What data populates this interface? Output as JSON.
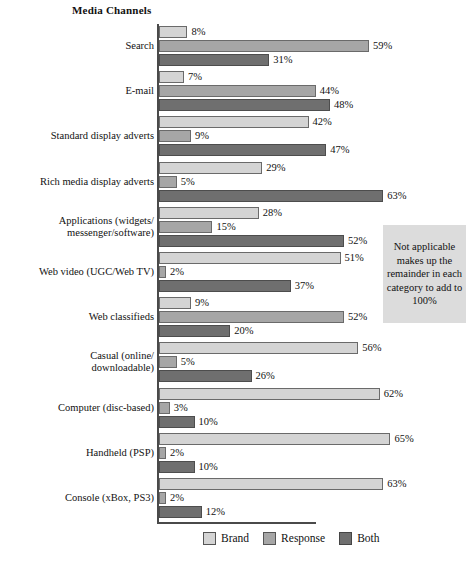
{
  "chart_data": {
    "type": "bar",
    "orientation": "horizontal",
    "title": "Media Channels",
    "xlabel": "",
    "ylabel": "",
    "xlim": [
      0,
      65
    ],
    "grid": false,
    "legend_position": "bottom",
    "value_suffix": "%",
    "categories": [
      "Search",
      "E-mail",
      "Standard display adverts",
      "Rich media display adverts",
      "Applications (widgets/\nmessenger/software)",
      "Web video (UGC/Web TV)",
      "Web classifieds",
      "Casual (online/\ndownloadable)",
      "Computer (disc-based)",
      "Handheld (PSP)",
      "Console (xBox, PS3)"
    ],
    "series": [
      {
        "name": "Brand",
        "color": "#d4d4d4",
        "values": [
          8,
          7,
          42,
          29,
          28,
          51,
          9,
          56,
          62,
          65,
          63
        ],
        "labels": [
          "8%",
          "7%",
          "42%",
          "29%",
          "28%",
          "51%",
          "9%",
          "56%",
          "62%",
          "65%",
          "63%"
        ]
      },
      {
        "name": "Response",
        "color": "#a6a6a6",
        "values": [
          59,
          44,
          9,
          5,
          15,
          2,
          52,
          5,
          3,
          2,
          2
        ],
        "labels": [
          "59%",
          "44%",
          "9%",
          "5%",
          "15%",
          "2%",
          "52%",
          "5%",
          "3%",
          "2%",
          "2%"
        ]
      },
      {
        "name": "Both",
        "color": "#6f6f6f",
        "values": [
          31,
          48,
          47,
          63,
          52,
          37,
          20,
          26,
          10,
          10,
          12
        ],
        "labels": [
          "31%",
          "48%",
          "47%",
          "63%",
          "52%",
          "37%",
          "20%",
          "26%",
          "10%",
          "10%",
          "12%"
        ]
      }
    ],
    "annotations": [
      {
        "name": "note-box",
        "text": "Not applicable makes up the remainder in each category to add to 100%"
      }
    ]
  },
  "legend": {
    "items": [
      {
        "label": "Brand",
        "swatch": "brand"
      },
      {
        "label": "Response",
        "swatch": "response"
      },
      {
        "label": "Both",
        "swatch": "both"
      }
    ]
  },
  "note": {
    "text": "Not applicable makes up the remainder in each category to add to 100%"
  }
}
